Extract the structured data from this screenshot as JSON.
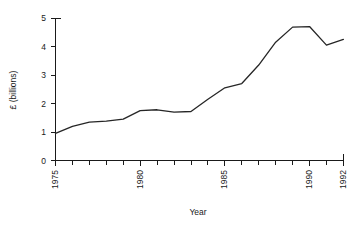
{
  "chart_data": {
    "type": "line",
    "title": "",
    "xlabel": "Year",
    "ylabel": "£ (billions)",
    "xlim": [
      1975,
      1992
    ],
    "ylim": [
      0,
      5
    ],
    "grid": false,
    "legend": null,
    "x_tick_labels": [
      "1975",
      "1980",
      "1985",
      "1990",
      "1992"
    ],
    "x_tick_values": [
      1975,
      1980,
      1985,
      1990,
      1992
    ],
    "x_minor_ticks": [
      1976,
      1977,
      1978,
      1979,
      1981,
      1982,
      1983,
      1984,
      1986,
      1987,
      1988,
      1989,
      1991
    ],
    "y_tick_labels": [
      "0",
      "1",
      "2",
      "3",
      "4",
      "5"
    ],
    "y_tick_values": [
      0,
      1,
      2,
      3,
      4,
      5
    ],
    "series": [
      {
        "name": "expenditure",
        "color": "#262626",
        "x": [
          1975,
          1976,
          1977,
          1978,
          1979,
          1980,
          1981,
          1982,
          1983,
          1984,
          1985,
          1986,
          1987,
          1988,
          1989,
          1990,
          1991,
          1992
        ],
        "values": [
          0.95,
          1.2,
          1.35,
          1.38,
          1.45,
          1.75,
          1.78,
          1.7,
          1.72,
          2.15,
          2.55,
          2.7,
          3.35,
          4.15,
          4.68,
          4.7,
          4.05,
          4.25
        ]
      }
    ]
  },
  "axes": {
    "x_title": "Year",
    "y_title": "£ (billions)"
  }
}
